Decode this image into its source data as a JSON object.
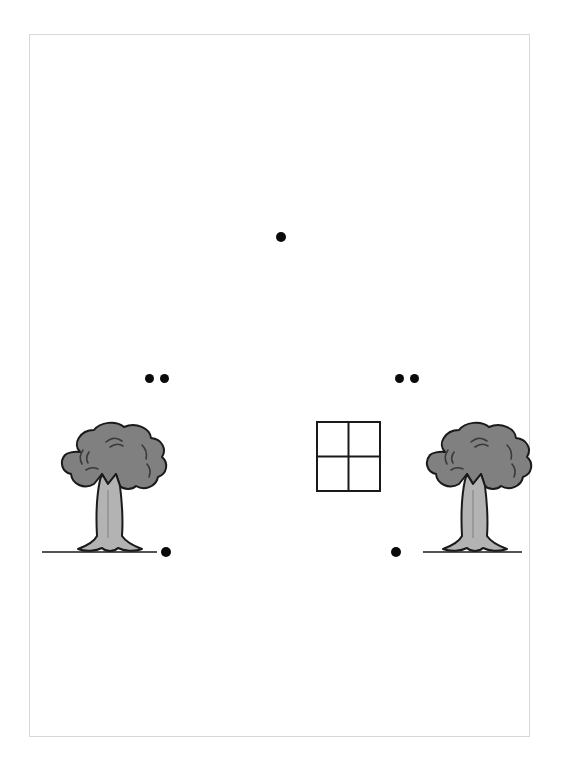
{
  "scene": {
    "width": 561,
    "height": 766,
    "background_color": "#ffffff",
    "title": "Two trees with a window and black dots"
  },
  "page_frame": {
    "x": 29,
    "y": 34,
    "width": 501,
    "height": 703,
    "border_color": "#d8d8d8",
    "fill_color": "#ffffff"
  },
  "palette": {
    "dot_color": "#0a0a0a",
    "canopy_fill": "#808080",
    "canopy_stroke": "#1a1a1a",
    "trunk_fill": "#b3b3b3",
    "trunk_stroke": "#1a1a1a",
    "ground_line_color": "#1a1a1a",
    "window_stroke": "#1a1a1a",
    "window_fill": "#ffffff"
  },
  "objects": {
    "trees": [
      {
        "name": "tree-left",
        "x": 50,
        "y": 418,
        "width": 110,
        "height": 140,
        "ground_line": {
          "x1": 42,
          "x2": 157,
          "y": 552
        }
      },
      {
        "name": "tree-right",
        "x": 415,
        "y": 418,
        "width": 110,
        "height": 140,
        "ground_line": {
          "x1": 423,
          "x2": 522,
          "y": 552
        }
      }
    ],
    "window": {
      "name": "window-grid",
      "x": 316,
      "y": 421,
      "width": 65,
      "height": 71,
      "rows": 2,
      "columns": 2,
      "panes": 4
    },
    "dots": [
      {
        "id": "dot-top-center",
        "cx": 281,
        "cy": 237,
        "r": 5
      },
      {
        "id": "dot-left-upper-a",
        "cx": 149,
        "cy": 378,
        "r": 4.5
      },
      {
        "id": "dot-left-upper-b",
        "cx": 164,
        "cy": 378,
        "r": 4.5
      },
      {
        "id": "dot-right-upper-a",
        "cx": 399,
        "cy": 378,
        "r": 4.5
      },
      {
        "id": "dot-right-upper-b",
        "cx": 414,
        "cy": 378,
        "r": 4.5
      },
      {
        "id": "dot-left-ground",
        "cx": 166,
        "cy": 552,
        "r": 5
      },
      {
        "id": "dot-right-ground",
        "cx": 396,
        "cy": 552,
        "r": 5
      }
    ]
  },
  "counts": {
    "tree_count": 2,
    "window_count": 1,
    "dot_count": 7
  }
}
